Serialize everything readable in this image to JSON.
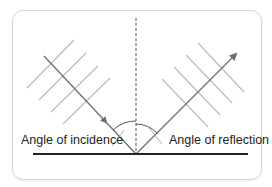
{
  "diagram": {
    "labels": {
      "incidence": "Angle of incidence",
      "reflection": "Angle of reflection"
    },
    "colors": {
      "background": "#ffffff",
      "frame": "#d6d6d6",
      "ray": "#6e6e6e",
      "wavefront": "#b8b8b8",
      "surface": "#222222",
      "normal": "#555555",
      "text": "#222222"
    }
  }
}
